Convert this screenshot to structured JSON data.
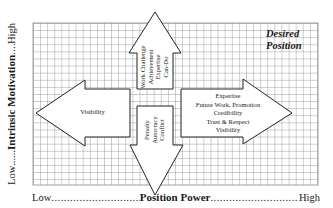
{
  "diagram": {
    "y_axis": {
      "low": "Low",
      "title": "Intrinsic Motivation",
      "high": "High",
      "dots_left": "......",
      "dots_right": "......"
    },
    "x_axis": {
      "low": "Low",
      "title": "Position Power",
      "high": "High",
      "dots_left": "...................................................",
      "dots_right": "..........................................."
    },
    "corner_label": {
      "line1": "Desired",
      "line2": "Position"
    },
    "arrows": {
      "up": {
        "direction": "up",
        "lines": [
          "Work Challenge",
          "Achievement",
          "Expertise",
          "Can-Do"
        ]
      },
      "down": {
        "direction": "down",
        "lines": [
          "Penalty",
          "Autocracy",
          "Conflict"
        ]
      },
      "left": {
        "direction": "left",
        "lines": [
          "Visibility"
        ]
      },
      "right": {
        "direction": "right",
        "lines": [
          "Expertise",
          "Future Work, Promotion",
          "Credibility",
          "Trust & Respect",
          "Visibility"
        ]
      }
    },
    "colors": {
      "grid": "#8a8a8a",
      "outline": "#222222",
      "fill": "#ffffff",
      "text": "#1a1a1a"
    }
  }
}
